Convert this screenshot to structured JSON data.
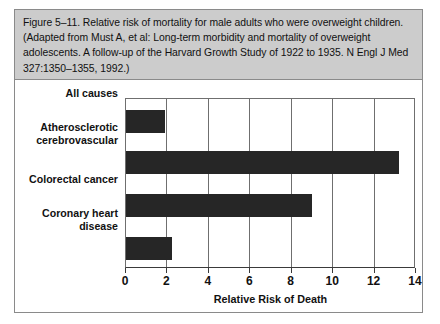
{
  "figure": {
    "caption": "Figure 5–11. Relative risk of mortality for male adults who were overweight children. (Adapted from Must A, et al: Long-term morbidity and mortality of overweight adolescents. A follow-up of the Harvard Growth Study of 1922 to 1935. N Engl J Med 327:1350–1355, 1992.)"
  },
  "colors": {
    "caption_background": "#cccccc",
    "bar_fill": "#262626",
    "frame": "#8a8a8a",
    "gridline": "#6f6f6f",
    "axis": "#3a3a3a",
    "page_background": "#ffffff"
  },
  "chart_data": {
    "type": "bar",
    "orientation": "horizontal",
    "title": "",
    "xlabel": "Relative Risk of Death",
    "ylabel": "",
    "categories": [
      "All causes",
      "Atherosclerotic cerebrovascular",
      "Colorectal cancer",
      "Coronary heart disease"
    ],
    "category_label_lines": [
      [
        "All causes"
      ],
      [
        "Atherosclerotic",
        "cerebrovascular"
      ],
      [
        "Colorectal cancer"
      ],
      [
        "Coronary heart",
        "disease"
      ]
    ],
    "values": [
      1.9,
      13.2,
      9.0,
      2.2
    ],
    "xlim": [
      0,
      14
    ],
    "xticks": [
      0,
      2,
      4,
      6,
      8,
      10,
      12,
      14
    ],
    "xtick_labels": [
      "0",
      "2",
      "4",
      "6",
      "8",
      "10",
      "12",
      "14"
    ],
    "grid": "vertical",
    "legend": null
  }
}
